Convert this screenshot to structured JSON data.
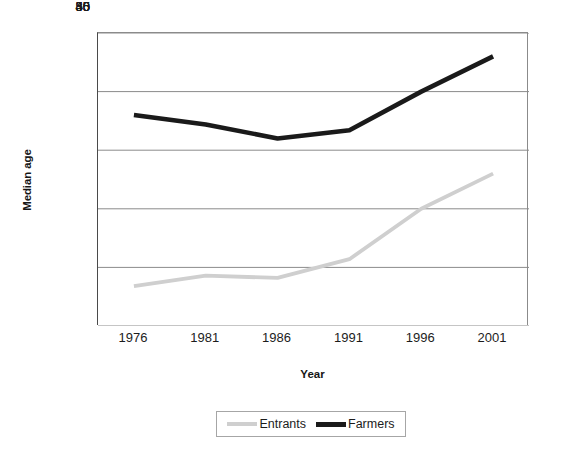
{
  "chart_data": {
    "type": "line",
    "title": "",
    "xlabel": "Year",
    "ylabel": "Median age",
    "categories": [
      "1976",
      "1981",
      "1986",
      "1991",
      "1996",
      "2001"
    ],
    "series": [
      {
        "name": "Entrants",
        "color": "#cfcfcf",
        "values": [
          33.4,
          34.3,
          34.1,
          35.7,
          40.0,
          43.0
        ]
      },
      {
        "name": "Farmers",
        "color": "#1a1a1a",
        "values": [
          48.0,
          47.2,
          46.0,
          46.7,
          50.0,
          53.0
        ]
      }
    ],
    "ylim": [
      30,
      55
    ],
    "yticks": [
      30,
      35,
      40,
      45,
      50,
      55
    ],
    "ytick_labels": [
      "30",
      "35",
      "40",
      "45",
      "50",
      "55"
    ],
    "grid": true,
    "grid_axis": "y",
    "legend_position": "bottom",
    "axis_color": "#8b8b8b",
    "gridline_color": "#8b8b8b",
    "background_color": "#ffffff"
  },
  "axes": {
    "y_title": "Median age",
    "x_title": "Year"
  },
  "legend": {
    "entries": [
      {
        "label": "Entrants",
        "color": "#cfcfcf"
      },
      {
        "label": "Farmers",
        "color": "#1a1a1a"
      }
    ]
  }
}
